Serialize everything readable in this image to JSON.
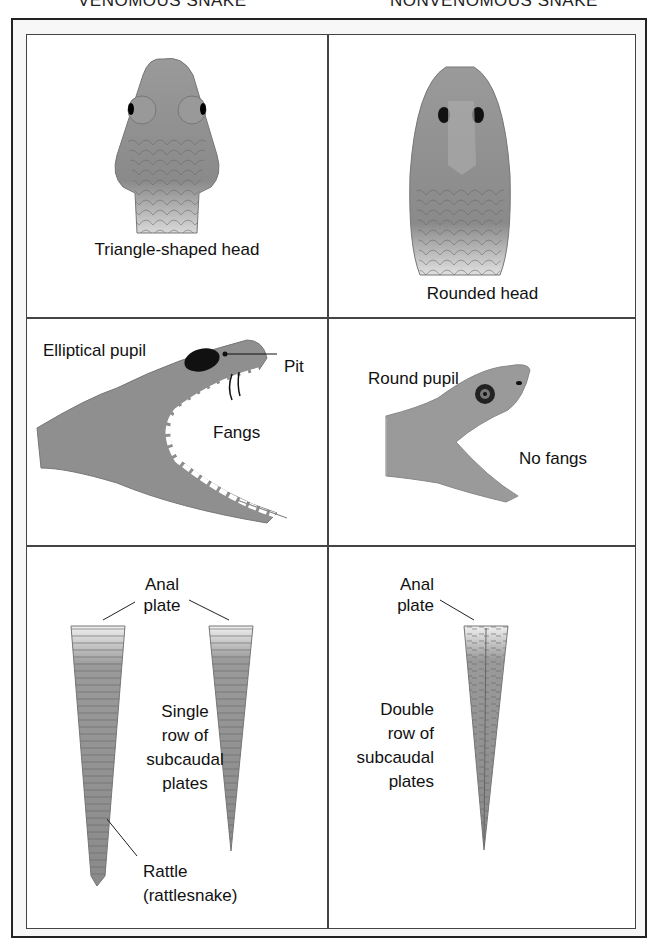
{
  "headers": {
    "left": "VENOMOUS SNAKE",
    "right": "NONVENOMOUS SNAKE"
  },
  "panels": {
    "venomous_head": {
      "caption": "Triangle-shaped head"
    },
    "nonvenomous_head": {
      "caption": "Rounded head"
    },
    "venomous_profile": {
      "pupil_label": "Elliptical pupil",
      "pit_label": "Pit",
      "fangs_label": "Fangs"
    },
    "nonvenomous_profile": {
      "pupil_label": "Round pupil",
      "fangs_label": "No fangs"
    },
    "venomous_tail": {
      "anal_plate_line1": "Anal",
      "anal_plate_line2": "plate",
      "subcaudal_lines": [
        "Single",
        "row of",
        "subcaudal",
        "plates"
      ],
      "rattle_line1": "Rattle",
      "rattle_line2": "(rattlesnake)"
    },
    "nonvenomous_tail": {
      "anal_plate_line1": "Anal",
      "anal_plate_line2": "plate",
      "subcaudal_lines": [
        "Double",
        "row of",
        "subcaudal",
        "plates"
      ]
    }
  },
  "colors": {
    "snake_fill": "#8a8a8a",
    "snake_light": "#c8c8c8",
    "border": "#444444"
  }
}
